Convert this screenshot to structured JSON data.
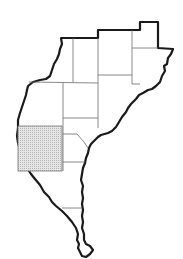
{
  "map": {
    "type": "locator map",
    "regions_count": 14,
    "highlighted_region_fill": "#d9d9d9",
    "outline_color": "#1a1a1a",
    "county_line_color": "#6b6b6b",
    "background": "#ffffff"
  }
}
